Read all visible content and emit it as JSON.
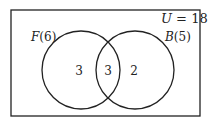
{
  "diagram": {
    "type": "venn",
    "universe": {
      "label_var": "U",
      "label_eq": " = 18",
      "total": 18
    },
    "sets": [
      {
        "name": "F",
        "count_label": "(6)",
        "total": 6
      },
      {
        "name": "B",
        "count_label": "(5)",
        "total": 5
      }
    ],
    "regions": {
      "only_F": "3",
      "F_and_B": "3",
      "only_B": "2"
    },
    "colors": {
      "stroke": "#222222",
      "background": "#ffffff"
    }
  }
}
